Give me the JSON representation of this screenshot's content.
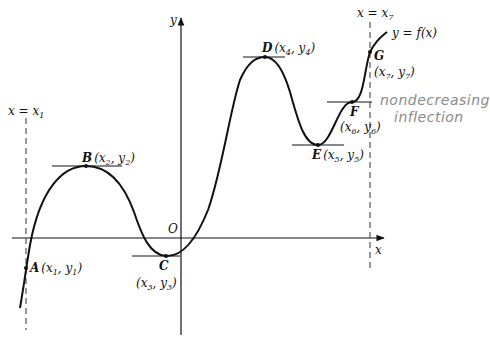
{
  "figure": {
    "curve_label": "y = f(x)",
    "axes": {
      "x_label": "x",
      "y_label": "y",
      "origin_label": "O"
    },
    "guide_lines": [
      {
        "label": "x = x",
        "sub": "1"
      },
      {
        "label": "x = x",
        "sub": "7"
      }
    ],
    "points": [
      {
        "name": "A",
        "coord": "(x",
        "x_sub": "1",
        "mid": ", y",
        "y_sub": "1",
        "close": ")"
      },
      {
        "name": "B",
        "coord": "(x",
        "x_sub": "2",
        "mid": ", y",
        "y_sub": "2",
        "close": ")"
      },
      {
        "name": "C",
        "coord": "(x",
        "x_sub": "3",
        "mid": ", y",
        "y_sub": "3",
        "close": ")"
      },
      {
        "name": "D",
        "coord": "(x",
        "x_sub": "4",
        "mid": ", y",
        "y_sub": "4",
        "close": ")"
      },
      {
        "name": "E",
        "coord": "(x",
        "x_sub": "5",
        "mid": ", y",
        "y_sub": "5",
        "close": ")"
      },
      {
        "name": "F",
        "coord": "(x",
        "x_sub": "6",
        "mid": ", y",
        "y_sub": "6",
        "close": ")"
      },
      {
        "name": "G",
        "coord": "(x",
        "x_sub": "7",
        "mid": ", y",
        "y_sub": "7",
        "close": ")"
      }
    ],
    "annotation": {
      "line1": "nondecreasing",
      "line2": "inflection"
    },
    "colors": {
      "ink": "#111111",
      "handwriting": "#8a8a8a",
      "background": "#ffffff"
    }
  }
}
